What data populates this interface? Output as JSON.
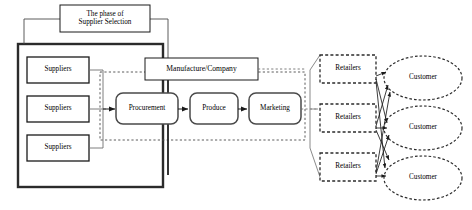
{
  "diagram": {
    "title_box": {
      "line1": "The phase of",
      "line2": "Supplier Selection"
    },
    "company_box": {
      "label": "Manufacture/Company"
    },
    "suppliers": [
      {
        "label": "Suppliers"
      },
      {
        "label": "Suppliers"
      },
      {
        "label": "Suppliers"
      }
    ],
    "process": [
      {
        "label": "Procurement"
      },
      {
        "label": "Produce"
      },
      {
        "label": "Marketing"
      }
    ],
    "retailers": [
      {
        "label": "Retailers"
      },
      {
        "label": "Retailers"
      },
      {
        "label": "Retailers"
      }
    ],
    "customers": [
      {
        "label": "Customer"
      },
      {
        "label": "Customer"
      },
      {
        "label": "Customer"
      }
    ],
    "colors": {
      "stroke": "#1a1a1a",
      "thick_stroke": "#2b2b2b",
      "light_stroke": "#7a7a7a",
      "dashed_stroke": "#3a3a3a",
      "background": "#ffffff",
      "text": "#000000"
    }
  }
}
